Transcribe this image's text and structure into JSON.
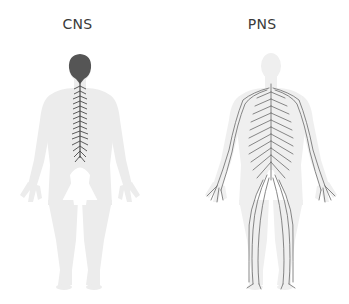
{
  "figures": [
    {
      "id": "cns",
      "label": "CNS",
      "description": "Central nervous system: brain and spinal cord highlighted on a light body silhouette",
      "highlight_color": "#555555",
      "body_color": "#ececec"
    },
    {
      "id": "pns",
      "label": "PNS",
      "description": "Peripheral nervous system: nerves branching throughout the body on a light body silhouette",
      "highlight_color": "#6a6a6a",
      "body_color": "#efefef"
    }
  ],
  "colors": {
    "background": "#ffffff",
    "label_text": "#3a3a3a"
  }
}
